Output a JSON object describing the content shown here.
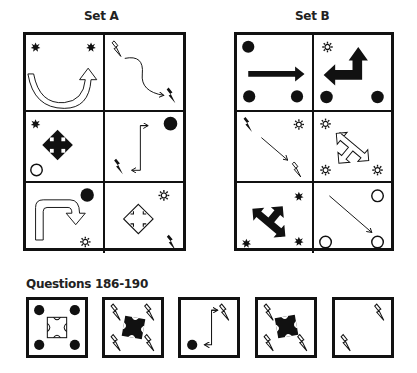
{
  "set_a": {
    "title": "Set A",
    "cells": [
      {
        "id": "a1",
        "symbols": [
          "star-burst",
          "star-burst",
          "u-turn-arrow-outline"
        ]
      },
      {
        "id": "a2",
        "symbols": [
          "lightning-outline",
          "wavy-arrow",
          "lightning-filled"
        ]
      },
      {
        "id": "a3",
        "symbols": [
          "star-burst",
          "four-way-arrow-filled",
          "circle-outline"
        ]
      },
      {
        "id": "a4",
        "symbols": [
          "circle-filled",
          "z-arrow",
          "lightning-filled"
        ]
      },
      {
        "id": "a5",
        "symbols": [
          "circle-filled",
          "hook-arrow-outline",
          "sun-outline"
        ]
      },
      {
        "id": "a6",
        "symbols": [
          "sun-outline",
          "four-way-arrow-outline",
          "lightning-filled"
        ]
      }
    ]
  },
  "set_b": {
    "title": "Set B",
    "cells": [
      {
        "id": "b1",
        "symbols": [
          "circle-filled",
          "right-arrow-filled",
          "circle-filled",
          "circle-filled"
        ]
      },
      {
        "id": "b2",
        "symbols": [
          "sun-outline",
          "bent-arrow-filled",
          "circle-filled",
          "circle-filled"
        ]
      },
      {
        "id": "b3",
        "symbols": [
          "lightning-filled",
          "sun-outline",
          "diagonal-arrow",
          "lightning-outline"
        ]
      },
      {
        "id": "b4",
        "symbols": [
          "sun-outline",
          "t-arrow-outline",
          "sun-outline",
          "sun-outline"
        ]
      },
      {
        "id": "b5",
        "symbols": [
          "star-burst",
          "t-arrow-filled",
          "star-burst",
          "star-burst"
        ]
      },
      {
        "id": "b6",
        "symbols": [
          "circle-outline",
          "diagonal-arrow",
          "circle-outline",
          "circle-outline"
        ]
      }
    ]
  },
  "questions": {
    "title": "Questions 186-190",
    "items": [
      {
        "number": 186,
        "symbols": [
          "circle-filled",
          "circle-filled",
          "circle-filled",
          "circle-filled",
          "four-way-arrow-outline-square"
        ]
      },
      {
        "number": 187,
        "symbols": [
          "lightning-outline",
          "lightning-outline",
          "lightning-outline",
          "lightning-outline",
          "four-way-arrow-filled"
        ]
      },
      {
        "number": 188,
        "symbols": [
          "z-arrow",
          "lightning-outline",
          "circle-filled"
        ]
      },
      {
        "number": 189,
        "symbols": [
          "lightning-outline",
          "four-way-arrow-filled",
          "lightning-outline",
          "lightning-outline"
        ]
      },
      {
        "number": 190,
        "symbols": [
          "lightning-outline",
          "lightning-outline"
        ]
      }
    ]
  },
  "colors": {
    "ink": "#111111",
    "background": "#ffffff"
  }
}
